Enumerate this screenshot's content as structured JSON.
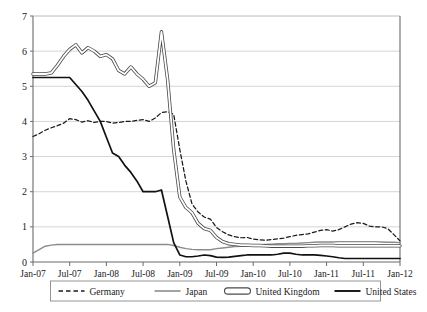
{
  "chart_data": {
    "type": "line",
    "title": "",
    "xlabel": "",
    "ylabel": "",
    "ylim": [
      0,
      7
    ],
    "y_ticks": [
      0,
      1,
      2,
      3,
      4,
      5,
      6,
      7
    ],
    "grid": true,
    "legend_position": "bottom",
    "x_tick_labels": [
      "Jan-07",
      "Jul-07",
      "Jan-08",
      "Jul-08",
      "Jan-09",
      "Jul-09",
      "Jan-10",
      "Jul-10",
      "Jan-11",
      "Jul-11",
      "Jan-12"
    ],
    "x_tick_indices": [
      0,
      6,
      12,
      18,
      24,
      30,
      36,
      42,
      48,
      54,
      60
    ],
    "x": [
      "Jan-07",
      "Feb-07",
      "Mar-07",
      "Apr-07",
      "May-07",
      "Jun-07",
      "Jul-07",
      "Aug-07",
      "Sep-07",
      "Oct-07",
      "Nov-07",
      "Dec-07",
      "Jan-08",
      "Feb-08",
      "Mar-08",
      "Apr-08",
      "May-08",
      "Jun-08",
      "Jul-08",
      "Aug-08",
      "Sep-08",
      "Oct-08",
      "Nov-08",
      "Dec-08",
      "Jan-09",
      "Feb-09",
      "Mar-09",
      "Apr-09",
      "May-09",
      "Jun-09",
      "Jul-09",
      "Aug-09",
      "Sep-09",
      "Oct-09",
      "Nov-09",
      "Dec-09",
      "Jan-10",
      "Feb-10",
      "Mar-10",
      "Apr-10",
      "May-10",
      "Jun-10",
      "Jul-10",
      "Aug-10",
      "Sep-10",
      "Oct-10",
      "Nov-10",
      "Dec-10",
      "Jan-11",
      "Feb-11",
      "Mar-11",
      "Apr-11",
      "May-11",
      "Jun-11",
      "Jul-11",
      "Aug-11",
      "Sep-11",
      "Oct-11",
      "Nov-11",
      "Dec-11",
      "Jan-12"
    ],
    "series": [
      {
        "name": "Germany",
        "style": "dashed",
        "color": "#1a1a1a",
        "values": [
          3.57,
          3.65,
          3.75,
          3.82,
          3.88,
          3.95,
          4.08,
          4.05,
          3.98,
          4.02,
          3.97,
          4.0,
          4.0,
          3.95,
          3.97,
          4.0,
          4.0,
          4.03,
          4.05,
          4.0,
          4.1,
          4.25,
          4.28,
          4.2,
          3.2,
          2.3,
          1.65,
          1.42,
          1.28,
          1.22,
          0.98,
          0.86,
          0.77,
          0.72,
          0.69,
          0.7,
          0.65,
          0.63,
          0.62,
          0.64,
          0.66,
          0.68,
          0.72,
          0.76,
          0.78,
          0.8,
          0.85,
          0.9,
          0.92,
          0.88,
          0.92,
          1.0,
          1.08,
          1.12,
          1.1,
          1.02,
          1.0,
          1.0,
          0.95,
          0.78,
          0.6
        ]
      },
      {
        "name": "Japan",
        "style": "solid-gray",
        "color": "#8c8c8c",
        "values": [
          0.25,
          0.35,
          0.45,
          0.48,
          0.5,
          0.5,
          0.5,
          0.5,
          0.5,
          0.5,
          0.5,
          0.5,
          0.5,
          0.5,
          0.5,
          0.5,
          0.5,
          0.5,
          0.5,
          0.5,
          0.5,
          0.5,
          0.5,
          0.47,
          0.42,
          0.38,
          0.36,
          0.35,
          0.35,
          0.35,
          0.38,
          0.4,
          0.42,
          0.44,
          0.45,
          0.47,
          0.48,
          0.49,
          0.5,
          0.51,
          0.52,
          0.52,
          0.53,
          0.53,
          0.54,
          0.55,
          0.56,
          0.57,
          0.57,
          0.57,
          0.58,
          0.58,
          0.58,
          0.58,
          0.58,
          0.58,
          0.58,
          0.57,
          0.56,
          0.56,
          0.55
        ]
      },
      {
        "name": "United Kingdom",
        "style": "double",
        "color": "#4a4a4a",
        "values": [
          5.35,
          5.35,
          5.35,
          5.38,
          5.6,
          5.85,
          6.05,
          6.18,
          5.95,
          6.1,
          6.0,
          5.85,
          5.9,
          5.78,
          5.45,
          5.35,
          5.55,
          5.35,
          5.2,
          5.0,
          5.1,
          6.55,
          5.2,
          3.2,
          1.85,
          1.55,
          1.4,
          1.1,
          0.95,
          0.9,
          0.7,
          0.58,
          0.52,
          0.5,
          0.48,
          0.48,
          0.47,
          0.47,
          0.46,
          0.45,
          0.45,
          0.45,
          0.45,
          0.45,
          0.45,
          0.46,
          0.46,
          0.47,
          0.47,
          0.47,
          0.46,
          0.46,
          0.46,
          0.46,
          0.46,
          0.46,
          0.46,
          0.46,
          0.46,
          0.46,
          0.46
        ]
      },
      {
        "name": "United States",
        "style": "solid-black",
        "color": "#111111",
        "values": [
          5.25,
          5.25,
          5.25,
          5.25,
          5.25,
          5.25,
          5.25,
          5.05,
          4.85,
          4.6,
          4.3,
          4.0,
          3.55,
          3.1,
          3.0,
          2.75,
          2.55,
          2.3,
          2.0,
          2.0,
          2.0,
          2.05,
          1.3,
          0.55,
          0.2,
          0.15,
          0.15,
          0.17,
          0.2,
          0.18,
          0.14,
          0.13,
          0.14,
          0.16,
          0.18,
          0.2,
          0.2,
          0.2,
          0.2,
          0.2,
          0.22,
          0.25,
          0.25,
          0.22,
          0.2,
          0.2,
          0.2,
          0.19,
          0.17,
          0.15,
          0.12,
          0.1,
          0.1,
          0.1,
          0.1,
          0.1,
          0.1,
          0.1,
          0.1,
          0.1,
          0.1
        ]
      }
    ],
    "legend_entries": [
      {
        "label": "Germany",
        "swatch": "dashed"
      },
      {
        "label": "Japan",
        "swatch": "solid-gray"
      },
      {
        "label": "United Kingdom",
        "swatch": "double"
      },
      {
        "label": "United States",
        "swatch": "solid-black"
      }
    ]
  }
}
